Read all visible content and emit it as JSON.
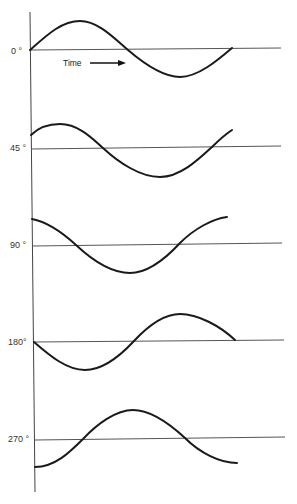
{
  "diagram": {
    "title": "",
    "time_label": "Time",
    "time_arrow": "right-arrow-icon",
    "colors": {
      "line": "#1a1a1a",
      "axis": "#444444",
      "background": "#ffffff"
    },
    "panels": [
      {
        "phase_label": "0 °",
        "phase_deg": 0,
        "start": "zero, rising"
      },
      {
        "phase_label": "45 °",
        "phase_deg": 45,
        "start": "positive, rising to peak"
      },
      {
        "phase_label": "90 °",
        "phase_deg": 90,
        "start": "peak, falling"
      },
      {
        "phase_label": "180°",
        "phase_deg": 180,
        "start": "zero, falling"
      },
      {
        "phase_label": "270 °",
        "phase_deg": 270,
        "start": "trough, rising"
      }
    ]
  }
}
